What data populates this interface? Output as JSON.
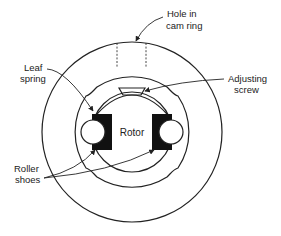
{
  "diagram": {
    "type": "mechanical-cross-section",
    "labels": {
      "hole": [
        "Hole in",
        "cam ring"
      ],
      "leaf_spring": [
        "Leaf",
        "spring"
      ],
      "adjusting_screw": [
        "Adjusting",
        "screw"
      ],
      "rotor": "Rotor",
      "roller_shoes": [
        "Roller",
        "shoes"
      ]
    },
    "colors": {
      "line": "#222222",
      "fill_dark": "#111111",
      "background": "#ffffff"
    }
  }
}
